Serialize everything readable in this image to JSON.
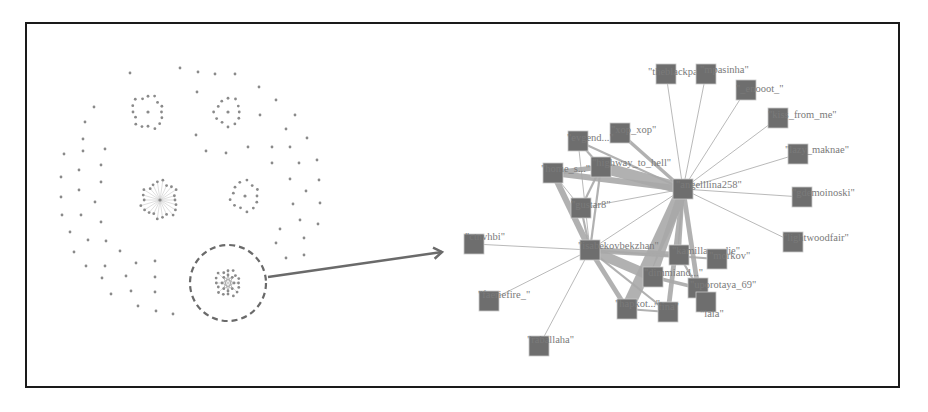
{
  "overview": {
    "highlight_circle": {
      "cx": 228,
      "cy": 283,
      "r": 38
    },
    "arrow": {
      "x1": 268,
      "y1": 277,
      "x2": 442,
      "y2": 252
    },
    "clusters": [
      {
        "name": "cluster-top-left",
        "cx": 148,
        "cy": 112,
        "r": 18,
        "count": 16,
        "hub": true,
        "spokes": false
      },
      {
        "name": "cluster-top-center",
        "cx": 228,
        "cy": 112,
        "r": 15,
        "count": 12,
        "hub": true,
        "spokes": false
      },
      {
        "name": "cluster-mid-left",
        "cx": 160,
        "cy": 200,
        "r": 20,
        "count": 22,
        "hub": true,
        "spokes": true
      },
      {
        "name": "cluster-mid-right",
        "cx": 245,
        "cy": 196,
        "r": 16,
        "count": 13,
        "hub": true,
        "spokes": false
      },
      {
        "name": "cluster-highlighted",
        "cx": 228,
        "cy": 283,
        "r": 14,
        "count": 16,
        "hub": false,
        "spokes": true
      }
    ],
    "scatter_dots": [
      [
        130,
        73
      ],
      [
        180,
        68
      ],
      [
        198,
        72
      ],
      [
        215,
        74
      ],
      [
        235,
        74
      ],
      [
        259,
        87
      ],
      [
        197,
        92
      ],
      [
        276,
        100
      ],
      [
        94,
        107
      ],
      [
        85,
        122
      ],
      [
        260,
        115
      ],
      [
        295,
        115
      ],
      [
        196,
        135
      ],
      [
        286,
        129
      ],
      [
        307,
        138
      ],
      [
        83,
        139
      ],
      [
        83,
        151
      ],
      [
        105,
        149
      ],
      [
        64,
        154
      ],
      [
        206,
        151
      ],
      [
        226,
        153
      ],
      [
        248,
        147
      ],
      [
        272,
        147
      ],
      [
        290,
        147
      ],
      [
        272,
        163
      ],
      [
        299,
        163
      ],
      [
        317,
        160
      ],
      [
        79,
        170
      ],
      [
        101,
        165
      ],
      [
        61,
        177
      ],
      [
        101,
        182
      ],
      [
        290,
        179
      ],
      [
        319,
        180
      ],
      [
        79,
        190
      ],
      [
        61,
        197
      ],
      [
        95,
        202
      ],
      [
        306,
        191
      ],
      [
        293,
        204
      ],
      [
        320,
        203
      ],
      [
        62,
        215
      ],
      [
        81,
        215
      ],
      [
        101,
        222
      ],
      [
        300,
        220
      ],
      [
        318,
        224
      ],
      [
        70,
        232
      ],
      [
        88,
        240
      ],
      [
        106,
        241
      ],
      [
        280,
        229
      ],
      [
        304,
        238
      ],
      [
        74,
        252
      ],
      [
        120,
        251
      ],
      [
        276,
        243
      ],
      [
        286,
        258
      ],
      [
        304,
        255
      ],
      [
        86,
        266
      ],
      [
        105,
        266
      ],
      [
        136,
        263
      ],
      [
        155,
        261
      ],
      [
        102,
        278
      ],
      [
        126,
        276
      ],
      [
        155,
        277
      ],
      [
        111,
        294
      ],
      [
        131,
        291
      ],
      [
        155,
        292
      ],
      [
        138,
        306
      ],
      [
        156,
        311
      ],
      [
        173,
        314
      ]
    ]
  },
  "network": {
    "hubs": [
      "angelllina258",
      "isabekovbekzhan"
    ],
    "nodes": [
      {
        "id": "theblackpanda",
        "label": "\"theblackpanda\"",
        "x": 666,
        "y": 82,
        "lx": 648,
        "ly": 75
      },
      {
        "id": "mpasinha",
        "label": "\"mpasinha\"",
        "x": 706,
        "y": 82,
        "lx": 700,
        "ly": 73
      },
      {
        "id": "enooot",
        "label": "\"_enooot_\"",
        "x": 746,
        "y": 98,
        "lx": 736,
        "ly": 92
      },
      {
        "id": "kiss_from_me",
        "label": "\"kiss_from_me\"",
        "x": 778,
        "y": 126,
        "lx": 768,
        "ly": 118
      },
      {
        "id": "lazy_maknae",
        "label": "\"lazy_maknae\"",
        "x": 798,
        "y": 162,
        "lx": 785,
        "ly": 153
      },
      {
        "id": "gdemoinoski",
        "label": "\"gdemoinoski\"",
        "x": 802,
        "y": 205,
        "lx": 792,
        "ly": 196
      },
      {
        "id": "lightwoodfair",
        "label": "\"lightwoodfair\"",
        "x": 793,
        "y": 250,
        "lx": 783,
        "ly": 241
      },
      {
        "id": "xop_xop",
        "label": "\"xop_xop\"",
        "x": 620,
        "y": 141,
        "lx": 611,
        "ly": 133
      },
      {
        "id": "evgeniy",
        "label": "\"evgend...\"",
        "x": 578,
        "y": 149,
        "lx": 567,
        "ly": 141
      },
      {
        "id": "highway_to_hell",
        "label": "\"highway_to_hell\"",
        "x": 601,
        "y": 175,
        "lx": 592,
        "ly": 166
      },
      {
        "id": "home_s",
        "label": "\"home_s...\"",
        "x": 553,
        "y": 181,
        "lx": 541,
        "ly": 172
      },
      {
        "id": "angelllina258",
        "label": "\"angelllina258\"",
        "x": 683,
        "y": 197,
        "lx": 676,
        "ly": 188
      },
      {
        "id": "gustar8",
        "label": "\"gustar8\"",
        "x": 581,
        "y": 216,
        "lx": 571,
        "ly": 208
      },
      {
        "id": "ctnvhbi",
        "label": "\"ctnvhbi\"",
        "x": 474,
        "y": 252,
        "lx": 465,
        "ly": 240
      },
      {
        "id": "isabekovbekzhan",
        "label": "\"isabekovbekzhan\"",
        "x": 590,
        "y": 258,
        "lx": 578,
        "ly": 249
      },
      {
        "id": "kamillaya_die",
        "label": "\"kamillaya_die\"",
        "x": 679,
        "y": 263,
        "lx": 672,
        "ly": 254
      },
      {
        "id": "morkov",
        "label": "\"morkov\"",
        "x": 717,
        "y": 267,
        "lx": 709,
        "ly": 259
      },
      {
        "id": "dimmiand",
        "label": "\"dimmiand...\"",
        "x": 653,
        "y": 285,
        "lx": 644,
        "ly": 276
      },
      {
        "id": "uporotaya_69",
        "label": "\"uporotaya_69\"",
        "x": 698,
        "y": 296,
        "lx": 690,
        "ly": 288
      },
      {
        "id": "faeriefire",
        "label": "\"faeriefire_\"",
        "x": 489,
        "y": 309,
        "lx": 478,
        "ly": 298
      },
      {
        "id": "hapkot",
        "label": "\"hapkot...\"",
        "x": 627,
        "y": 317,
        "lx": 615,
        "ly": 307
      },
      {
        "id": "fina",
        "label": "\"fina\"",
        "x": 668,
        "y": 320,
        "lx": 654,
        "ly": 310
      },
      {
        "id": "lala",
        "label": "\"lala\"",
        "x": 706,
        "y": 310,
        "lx": 700,
        "ly": 317
      },
      {
        "id": "raballaha",
        "label": "\"raballaha\"",
        "x": 539,
        "y": 354,
        "lx": 527,
        "ly": 343
      }
    ],
    "edges": [
      {
        "s": "angelllina258",
        "t": "theblackpanda",
        "w": 1
      },
      {
        "s": "angelllina258",
        "t": "mpasinha",
        "w": 1
      },
      {
        "s": "angelllina258",
        "t": "enooot",
        "w": 1
      },
      {
        "s": "angelllina258",
        "t": "kiss_from_me",
        "w": 1
      },
      {
        "s": "angelllina258",
        "t": "lazy_maknae",
        "w": 1
      },
      {
        "s": "angelllina258",
        "t": "gdemoinoski",
        "w": 1
      },
      {
        "s": "angelllina258",
        "t": "lightwoodfair",
        "w": 1
      },
      {
        "s": "angelllina258",
        "t": "xop_xop",
        "w": 3
      },
      {
        "s": "angelllina258",
        "t": "evgeniy",
        "w": 2
      },
      {
        "s": "angelllina258",
        "t": "highway_to_hell",
        "w": 9
      },
      {
        "s": "angelllina258",
        "t": "home_s",
        "w": 5
      },
      {
        "s": "angelllina258",
        "t": "gustar8",
        "w": 1
      },
      {
        "s": "angelllina258",
        "t": "isabekovbekzhan",
        "w": 1
      },
      {
        "s": "angelllina258",
        "t": "hapkot",
        "w": 10
      },
      {
        "s": "angelllina258",
        "t": "dimmiand",
        "w": 6
      },
      {
        "s": "angelllina258",
        "t": "kamillaya_die",
        "w": 3
      },
      {
        "s": "angelllina258",
        "t": "uporotaya_69",
        "w": 4
      },
      {
        "s": "angelllina258",
        "t": "fina",
        "w": 4
      },
      {
        "s": "isabekovbekzhan",
        "t": "ctnvhbi",
        "w": 1
      },
      {
        "s": "isabekovbekzhan",
        "t": "faeriefire",
        "w": 1
      },
      {
        "s": "isabekovbekzhan",
        "t": "raballaha",
        "w": 1
      },
      {
        "s": "isabekovbekzhan",
        "t": "gustar8",
        "w": 2
      },
      {
        "s": "isabekovbekzhan",
        "t": "home_s",
        "w": 5
      },
      {
        "s": "isabekovbekzhan",
        "t": "highway_to_hell",
        "w": 2
      },
      {
        "s": "isabekovbekzhan",
        "t": "evgeniy",
        "w": 1
      },
      {
        "s": "isabekovbekzhan",
        "t": "kamillaya_die",
        "w": 5
      },
      {
        "s": "isabekovbekzhan",
        "t": "dimmiand",
        "w": 8
      },
      {
        "s": "isabekovbekzhan",
        "t": "hapkot",
        "w": 4
      },
      {
        "s": "isabekovbekzhan",
        "t": "fina",
        "w": 2
      },
      {
        "s": "isabekovbekzhan",
        "t": "morkov",
        "w": 2
      },
      {
        "s": "home_s",
        "t": "highway_to_hell",
        "w": 4
      },
      {
        "s": "evgeniy",
        "t": "highway_to_hell",
        "w": 2
      },
      {
        "s": "gustar8",
        "t": "highway_to_hell",
        "w": 2
      },
      {
        "s": "gustar8",
        "t": "home_s",
        "w": 1
      },
      {
        "s": "dimmiand",
        "t": "uporotaya_69",
        "w": 3
      },
      {
        "s": "kamillaya_die",
        "t": "uporotaya_69",
        "w": 2
      },
      {
        "s": "hapkot",
        "t": "fina",
        "w": 2
      }
    ]
  },
  "colors": {
    "node": "#6e6e6e",
    "node_border": "#c8c8c8",
    "edge": "#a8a8a8",
    "label": "#7a7a7a",
    "dot": "#8a8a8a",
    "arrow": "#6a6a6a",
    "frame": "#1a1a1a"
  }
}
